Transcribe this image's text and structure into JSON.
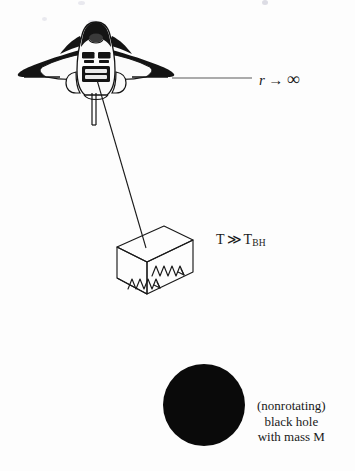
{
  "figure": {
    "background_color": "#fdfdfd",
    "ink_color": "#1a1a1a",
    "width": 355,
    "height": 471
  },
  "labels": {
    "r_infinity": {
      "variable": "r",
      "arrow": "→",
      "limit": "∞",
      "full_text": "r → ∞"
    },
    "temperature": {
      "symbol": "T",
      "relation": "≫",
      "reference_symbol": "T",
      "reference_subscript": "BH",
      "full_text": "T ≫ T_BH"
    },
    "black_hole": {
      "line1": "(nonrotating)",
      "line2": "black hole",
      "line3": "with mass M"
    }
  },
  "objects": {
    "spacecraft": {
      "name": "space-shuttle",
      "description": "front view of a winged space shuttle orbiter",
      "color": "#141414"
    },
    "tether": {
      "name": "tether-line",
      "description": "thin line from shuttle down to the radiation box"
    },
    "radiation_box": {
      "name": "radiation-box",
      "description": "3D rectangular box containing radiation",
      "wave_count": 2,
      "wave_direction": "right"
    },
    "black_hole_disc": {
      "name": "black-hole-disc",
      "fill": "#0a0a0a",
      "diameter": 82
    },
    "infinity_ray": {
      "name": "radial-line-to-infinity",
      "description": "horizontal line from shuttle toward r = infinity"
    }
  }
}
